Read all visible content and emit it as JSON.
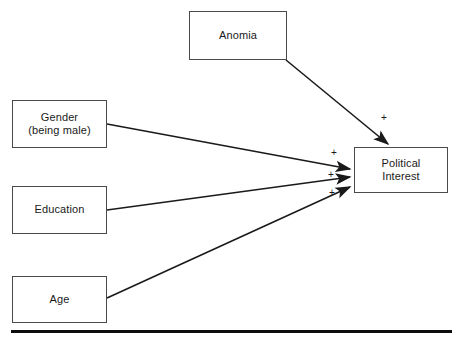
{
  "diagram": {
    "type": "path-model",
    "nodes": [
      {
        "id": "anomia",
        "label": "Anomia",
        "x": 189,
        "y": 11,
        "w": 98,
        "h": 49
      },
      {
        "id": "gender",
        "label": "Gender\n(being male)",
        "x": 12,
        "y": 100,
        "w": 95,
        "h": 48
      },
      {
        "id": "education",
        "label": "Education",
        "x": 12,
        "y": 186,
        "w": 95,
        "h": 48
      },
      {
        "id": "age",
        "label": "Age",
        "x": 12,
        "y": 276,
        "w": 95,
        "h": 47
      },
      {
        "id": "political_interest",
        "label": "Political\nInterest",
        "x": 354,
        "y": 147,
        "w": 94,
        "h": 46
      }
    ],
    "edges": [
      {
        "id": "anomia-to-political-interest",
        "from": "anomia",
        "to": "political_interest",
        "sign": "+",
        "sign_x": 381,
        "sign_y": 113,
        "x1": 286,
        "y1": 60,
        "x2": 389,
        "y2": 145
      },
      {
        "id": "gender-to-political-interest",
        "from": "gender",
        "to": "political_interest",
        "sign": "+",
        "sign_x": 331,
        "sign_y": 148,
        "x1": 107,
        "y1": 124,
        "x2": 352,
        "y2": 170
      },
      {
        "id": "education-to-political-interest",
        "from": "education",
        "to": "political_interest",
        "sign": "+",
        "sign_x": 328,
        "sign_y": 170,
        "x1": 107,
        "y1": 210,
        "x2": 352,
        "y2": 177
      },
      {
        "id": "age-to-political-interest",
        "from": "age",
        "to": "political_interest",
        "sign": "+",
        "sign_x": 329,
        "sign_y": 188,
        "x1": 107,
        "y1": 298,
        "x2": 352,
        "y2": 187
      }
    ],
    "baseline_rule": {
      "x": 11,
      "y": 330,
      "w": 441,
      "h": 3
    },
    "colors": {
      "box_border": "#4a4a4a",
      "box_fill": "#ffffff",
      "arrow": "#1a1a1a",
      "text": "#1a1a1a",
      "rule": "#0d0d0d",
      "background": "#ffffff"
    }
  }
}
